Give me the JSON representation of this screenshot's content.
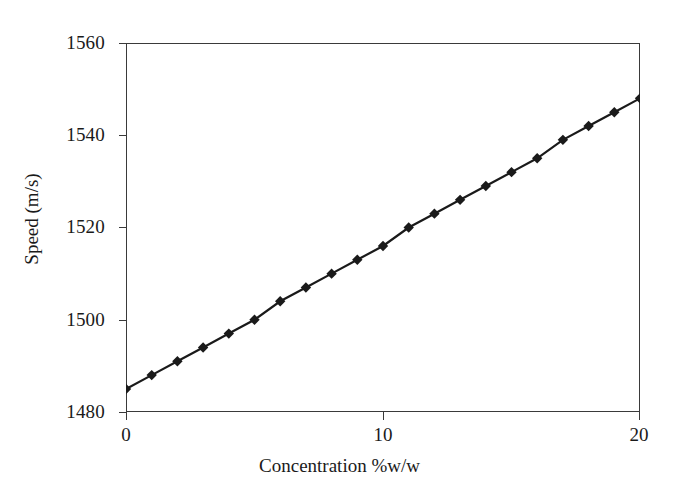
{
  "chart_data": {
    "type": "line",
    "title": "",
    "xlabel": "Concentration %w/w",
    "ylabel": "Speed (m/s)",
    "xlim": [
      0,
      20
    ],
    "ylim": [
      1480,
      1560
    ],
    "xticks": [
      0,
      10,
      20
    ],
    "yticks": [
      1480,
      1500,
      1520,
      1540,
      1560
    ],
    "xtick_labels": [
      "0",
      "10",
      "20"
    ],
    "ytick_labels": [
      "1480",
      "1500",
      "1520",
      "1540",
      "1560"
    ],
    "grid": false,
    "legend": null,
    "marker": "diamond",
    "marker_color": "#1a1a1a",
    "line_color": "#1a1a1a",
    "series": [
      {
        "name": "Speed vs concentration",
        "x": [
          0,
          1,
          2,
          3,
          4,
          5,
          6,
          7,
          8,
          9,
          10,
          11,
          12,
          13,
          14,
          15,
          16,
          17,
          18,
          19,
          20
        ],
        "y": [
          1485,
          1488,
          1491,
          1494,
          1497,
          1500,
          1504,
          1507,
          1510,
          1513,
          1516,
          1520,
          1523,
          1526,
          1529,
          1532,
          1535,
          1539,
          1542,
          1545,
          1548
        ]
      }
    ]
  }
}
